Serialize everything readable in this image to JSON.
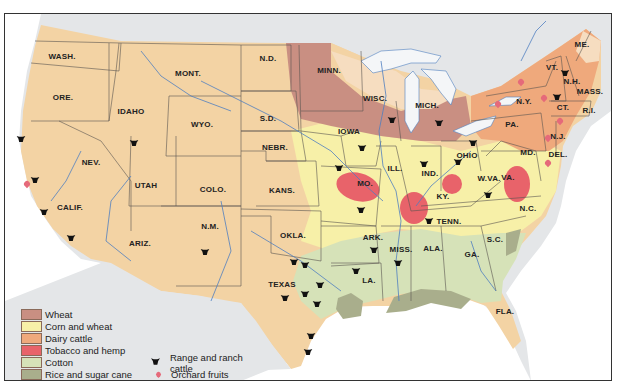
{
  "map": {
    "title": "United States agricultural regions",
    "colors": {
      "wheat": "#c98f82",
      "corn_and_wheat": "#f7f0a8",
      "dairy_cattle": "#efa97c",
      "tobacco_and_hemp": "#e8636a",
      "cotton": "#d6e2b8",
      "rice_and_sugar_cane": "#a9ae8c",
      "grazing_base": "#f3d3a4",
      "water": "#ffffff",
      "lakes": "#f4f6f8",
      "canada_mexico": "#e4e6e8",
      "river": "#4f7fc0"
    },
    "state_labels": [
      {
        "name": "WASH.",
        "x": 62,
        "y": 56
      },
      {
        "name": "ORE.",
        "x": 63,
        "y": 97
      },
      {
        "name": "IDAHO",
        "x": 131,
        "y": 111
      },
      {
        "name": "MONT.",
        "x": 188,
        "y": 73
      },
      {
        "name": "WYO.",
        "x": 202,
        "y": 124
      },
      {
        "name": "N.D.",
        "x": 268,
        "y": 58
      },
      {
        "name": "S.D.",
        "x": 268,
        "y": 118
      },
      {
        "name": "NEBR.",
        "x": 275,
        "y": 147
      },
      {
        "name": "NEV.",
        "x": 91,
        "y": 162
      },
      {
        "name": "UTAH",
        "x": 146,
        "y": 185
      },
      {
        "name": "COLO.",
        "x": 213,
        "y": 189
      },
      {
        "name": "KANS.",
        "x": 282,
        "y": 190
      },
      {
        "name": "CALIF.",
        "x": 70,
        "y": 207
      },
      {
        "name": "ARIZ.",
        "x": 140,
        "y": 243
      },
      {
        "name": "N.M.",
        "x": 210,
        "y": 226
      },
      {
        "name": "OKLA.",
        "x": 293,
        "y": 235
      },
      {
        "name": "TEXAS",
        "x": 282,
        "y": 284
      },
      {
        "name": "MINN.",
        "x": 329,
        "y": 70
      },
      {
        "name": "WISC.",
        "x": 375,
        "y": 98
      },
      {
        "name": "MICH.",
        "x": 427,
        "y": 105
      },
      {
        "name": "IOWA",
        "x": 349,
        "y": 131
      },
      {
        "name": "ILL.",
        "x": 395,
        "y": 168
      },
      {
        "name": "IND.",
        "x": 430,
        "y": 173
      },
      {
        "name": "OHIO",
        "x": 467,
        "y": 155
      },
      {
        "name": "MO.",
        "x": 365,
        "y": 183
      },
      {
        "name": "KY.",
        "x": 443,
        "y": 196
      },
      {
        "name": "W.VA.",
        "x": 489,
        "y": 178
      },
      {
        "name": "VA.",
        "x": 508,
        "y": 177
      },
      {
        "name": "MD.",
        "x": 528,
        "y": 152
      },
      {
        "name": "DEL.",
        "x": 558,
        "y": 154
      },
      {
        "name": "N.J.",
        "x": 558,
        "y": 136
      },
      {
        "name": "PA.",
        "x": 512,
        "y": 124
      },
      {
        "name": "N.Y.",
        "x": 524,
        "y": 101
      },
      {
        "name": "VT.",
        "x": 552,
        "y": 67
      },
      {
        "name": "N.H.",
        "x": 572,
        "y": 81
      },
      {
        "name": "ME.",
        "x": 582,
        "y": 44
      },
      {
        "name": "MASS.",
        "x": 590,
        "y": 91
      },
      {
        "name": "CT.",
        "x": 563,
        "y": 107
      },
      {
        "name": "R.I.",
        "x": 589,
        "y": 110
      },
      {
        "name": "N.C.",
        "x": 528,
        "y": 208
      },
      {
        "name": "TENN.",
        "x": 449,
        "y": 221
      },
      {
        "name": "ARK.",
        "x": 373,
        "y": 237
      },
      {
        "name": "S.C.",
        "x": 495,
        "y": 239
      },
      {
        "name": "MISS.",
        "x": 401,
        "y": 249
      },
      {
        "name": "ALA.",
        "x": 433,
        "y": 248
      },
      {
        "name": "GA.",
        "x": 472,
        "y": 254
      },
      {
        "name": "LA.",
        "x": 369,
        "y": 280
      },
      {
        "name": "FLA.",
        "x": 505,
        "y": 311
      }
    ],
    "cattle_markers": [
      {
        "x": 21,
        "y": 139
      },
      {
        "x": 35,
        "y": 180
      },
      {
        "x": 44,
        "y": 212
      },
      {
        "x": 71,
        "y": 238
      },
      {
        "x": 134,
        "y": 143
      },
      {
        "x": 205,
        "y": 252
      },
      {
        "x": 294,
        "y": 262
      },
      {
        "x": 305,
        "y": 265
      },
      {
        "x": 285,
        "y": 298
      },
      {
        "x": 305,
        "y": 294
      },
      {
        "x": 320,
        "y": 285
      },
      {
        "x": 317,
        "y": 304
      },
      {
        "x": 311,
        "y": 336
      },
      {
        "x": 308,
        "y": 352
      },
      {
        "x": 356,
        "y": 271
      },
      {
        "x": 374,
        "y": 250
      },
      {
        "x": 339,
        "y": 168
      },
      {
        "x": 361,
        "y": 210
      },
      {
        "x": 398,
        "y": 263
      },
      {
        "x": 392,
        "y": 120
      },
      {
        "x": 439,
        "y": 123
      },
      {
        "x": 362,
        "y": 148
      },
      {
        "x": 424,
        "y": 164
      },
      {
        "x": 458,
        "y": 162
      },
      {
        "x": 473,
        "y": 143
      },
      {
        "x": 488,
        "y": 195
      },
      {
        "x": 429,
        "y": 221
      },
      {
        "x": 565,
        "y": 73
      },
      {
        "x": 557,
        "y": 97
      }
    ],
    "orchard_markers": [
      {
        "x": 27,
        "y": 184
      },
      {
        "x": 498,
        "y": 104
      },
      {
        "x": 521,
        "y": 82
      },
      {
        "x": 544,
        "y": 98
      },
      {
        "x": 548,
        "y": 138
      },
      {
        "x": 548,
        "y": 163
      },
      {
        "x": 560,
        "y": 121
      }
    ]
  },
  "legend": {
    "regions": [
      {
        "label": "Wheat",
        "color": "#c98f82"
      },
      {
        "label": "Corn and wheat",
        "color": "#f7f0a8"
      },
      {
        "label": "Dairy cattle",
        "color": "#efa97c"
      },
      {
        "label": "Tobacco and hemp",
        "color": "#e8636a"
      },
      {
        "label": "Cotton",
        "color": "#d6e2b8"
      },
      {
        "label": "Rice and sugar cane",
        "color": "#a9ae8c"
      }
    ],
    "symbols": [
      {
        "label": "Range and ranch cattle",
        "icon": "cattle-head-icon"
      },
      {
        "label": "Orchard fruits",
        "icon": "orchard-fruit-icon"
      }
    ]
  }
}
